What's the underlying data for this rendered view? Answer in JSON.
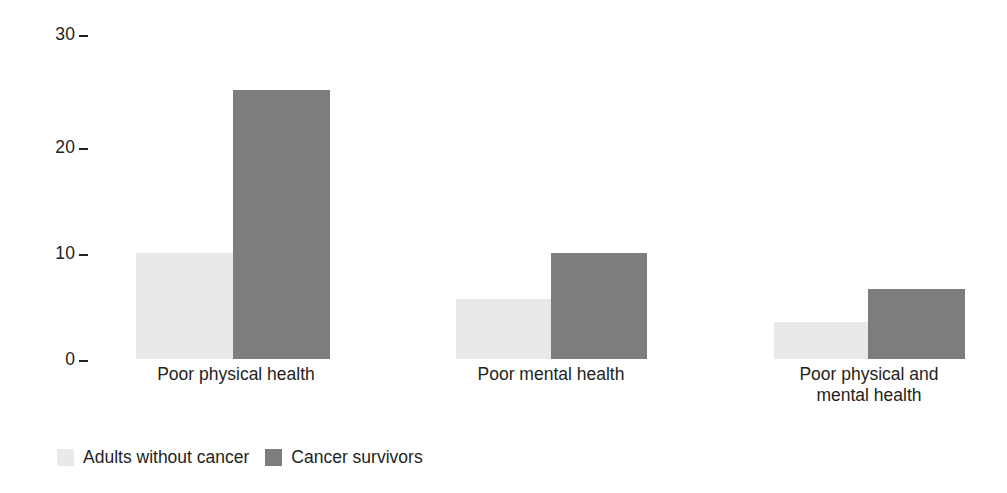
{
  "chart_data": {
    "type": "bar",
    "title": "",
    "subtitle": "",
    "xlabel": "",
    "ylabel": "",
    "ylim": [
      0,
      30
    ],
    "yticks": [
      0,
      10,
      20,
      30
    ],
    "ytick_labels": [
      "0",
      "10",
      "20",
      "30"
    ],
    "grid": false,
    "legend_position": "bottom-left",
    "categories": [
      "Poor physical health",
      "Poor mental health",
      "Poor physical and mental health"
    ],
    "category_lines": [
      [
        "Poor physical health"
      ],
      [
        "Poor mental health"
      ],
      [
        "Poor physical and",
        "mental health"
      ]
    ],
    "series": [
      {
        "name": "Adults without cancer",
        "color": "#e9e9e9",
        "values": [
          9.8,
          5.5,
          3.4
        ]
      },
      {
        "name": "Cancer survivors",
        "color": "#7d7d7d",
        "values": [
          24.8,
          9.8,
          6.5
        ]
      }
    ]
  },
  "axis": {
    "ticks": [
      {
        "label": "30",
        "value": 30
      },
      {
        "label": "20",
        "value": 20
      },
      {
        "label": "10",
        "value": 10
      },
      {
        "label": "0",
        "value": 0
      }
    ]
  },
  "legend": {
    "items": [
      {
        "label": "Adults without cancer",
        "color": "#e9e9e9"
      },
      {
        "label": "Cancer survivors",
        "color": "#7d7d7d"
      }
    ]
  },
  "layout": {
    "baseline_y": 359,
    "px_per_unit": 10.83,
    "groups": [
      {
        "light_left": 136,
        "light_right": 233,
        "dark_left": 233,
        "dark_right": 330,
        "label_center": 236,
        "label_top": 364
      },
      {
        "light_left": 456,
        "light_right": 551,
        "dark_left": 551,
        "dark_right": 647,
        "label_center": 551,
        "label_top": 364
      },
      {
        "light_left": 774,
        "light_right": 868,
        "dark_left": 868,
        "dark_right": 965,
        "label_center": 869,
        "label_top": 364
      }
    ],
    "tick_x_right": 88,
    "tick_y": [
      34,
      147,
      253,
      359
    ]
  },
  "colors": {
    "light_bar": "#e9e9e9",
    "dark_bar": "#7d7d7d",
    "text": "#231f20",
    "background": "#ffffff"
  }
}
